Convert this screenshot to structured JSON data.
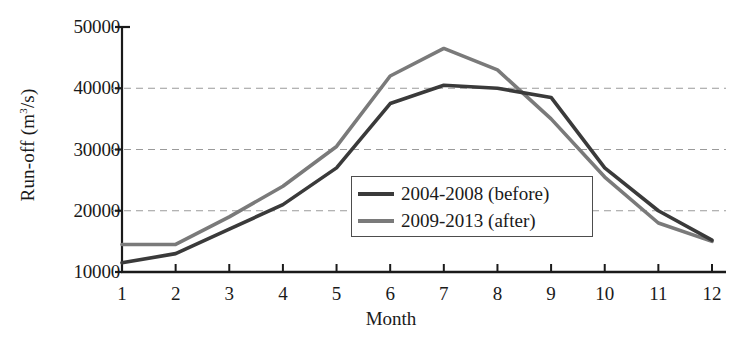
{
  "chart_data": {
    "type": "line",
    "title": "",
    "xlabel": "Month",
    "ylabel": "Run-off (m3/s)",
    "ylabel_base": "Run-off (m",
    "ylabel_sup": "3",
    "ylabel_tail": "/s)",
    "x": [
      1,
      2,
      3,
      4,
      5,
      6,
      7,
      8,
      9,
      10,
      11,
      12
    ],
    "xtick_labels": [
      "1",
      "2",
      "3",
      "4",
      "5",
      "6",
      "7",
      "8",
      "9",
      "10",
      "11",
      "12"
    ],
    "ytick_labels": [
      "10000",
      "20000",
      "30000",
      "40000",
      "50000"
    ],
    "ytick_values": [
      10000,
      20000,
      30000,
      40000,
      50000
    ],
    "ylim": [
      10000,
      50000
    ],
    "xlim": [
      1,
      12
    ],
    "grid": "horizontal-dashed",
    "gridlines_at": [
      20000,
      30000,
      40000
    ],
    "legend_position": "center-right-inside",
    "series": [
      {
        "name": "2004-2008 (before)",
        "color": "#3a3a3a",
        "values": [
          11500,
          13000,
          17000,
          21000,
          27000,
          37500,
          40500,
          40000,
          38500,
          27000,
          20000,
          15200
        ]
      },
      {
        "name": "2009-2013 (after)",
        "color": "#7a7a7a",
        "values": [
          14500,
          14500,
          19000,
          24000,
          30500,
          42000,
          46500,
          43000,
          35000,
          25500,
          18000,
          15000
        ]
      }
    ]
  },
  "legend": {
    "items": [
      {
        "label": "2004-2008 (before)"
      },
      {
        "label": "2009-2013 (after)"
      }
    ]
  },
  "axes": {
    "y_title": "Run-off (m3/s)",
    "x_title": "Month"
  },
  "colors": {
    "series_before": "#3a3a3a",
    "series_after": "#7a7a7a",
    "axis": "#1a1a1a",
    "grid": "#9a9a9a",
    "background": "#ffffff"
  }
}
